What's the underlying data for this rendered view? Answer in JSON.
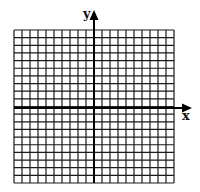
{
  "diagram": {
    "type": "coordinate-grid",
    "grid": {
      "columns": 20,
      "rows": 20,
      "x_min": -10,
      "x_max": 10,
      "y_min": -10,
      "y_max": 10,
      "line_color": "#1a1a1a",
      "background": "#ffffff"
    },
    "axes": {
      "x_label": "x",
      "y_label": "y",
      "color": "#000000",
      "arrowheads": [
        "x-positive",
        "y-positive"
      ]
    }
  }
}
